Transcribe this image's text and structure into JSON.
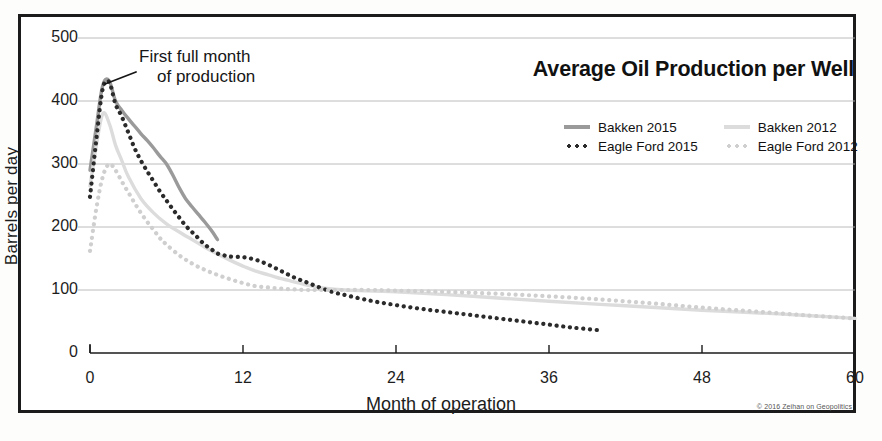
{
  "title": "Average Oil Production per Well",
  "annotation": {
    "line1": "First full month",
    "line2": "of production"
  },
  "copyright": "© 2016 Zeihan on Geopolitics",
  "axes": {
    "ylabel": "Barrels per day",
    "xlabel": "Month of operation",
    "yticks": [
      "500",
      "400",
      "300",
      "200",
      "100",
      "0"
    ],
    "xticks": [
      "0",
      "12",
      "24",
      "36",
      "48",
      "60"
    ]
  },
  "legend": {
    "entries": [
      {
        "label": "Bakken 2015",
        "style": "solid",
        "color": "#9a9a9a",
        "swatch": "sw-solid-dark"
      },
      {
        "label": "Bakken 2012",
        "style": "solid",
        "color": "#dcdcdc",
        "swatch": "sw-solid-light"
      },
      {
        "label": "Eagle Ford 2015",
        "style": "dotted",
        "color": "#2b2b2b",
        "swatch": "sw-dots-dark"
      },
      {
        "label": "Eagle Ford 2012",
        "style": "dotted",
        "color": "#cfcfcf",
        "swatch": "sw-dots-light"
      }
    ]
  },
  "chart_data": {
    "type": "line",
    "title": "Average Oil Production per Well",
    "xlabel": "Month of operation",
    "ylabel": "Barrels per day",
    "xlim": [
      0,
      60
    ],
    "ylim": [
      0,
      500
    ],
    "grid": true,
    "legend_position": "upper-right",
    "annotations": [
      {
        "text": "First full month of production",
        "points_to_x": 1.2,
        "points_to_y": 432
      }
    ],
    "series": [
      {
        "name": "Bakken 2015",
        "color": "#9a9a9a",
        "style": "solid",
        "x": [
          0,
          0.5,
          1,
          1.5,
          2,
          2.5,
          3,
          3.5,
          4,
          4.5,
          5,
          5.5,
          6,
          6.5,
          7,
          7.5,
          8,
          8.5,
          9,
          9.5,
          10
        ],
        "y": [
          290,
          360,
          425,
          432,
          400,
          385,
          372,
          360,
          348,
          337,
          325,
          312,
          300,
          282,
          262,
          245,
          232,
          220,
          208,
          195,
          180
        ]
      },
      {
        "name": "Bakken 2012",
        "color": "#dcdcdc",
        "style": "solid",
        "x": [
          0,
          0.5,
          1,
          1.5,
          2,
          2.5,
          3,
          4,
          5,
          6,
          7,
          8,
          9,
          10,
          11,
          12,
          13,
          14,
          15,
          16,
          17,
          18,
          20,
          24,
          30,
          36,
          42,
          48,
          54,
          60
        ],
        "y": [
          265,
          330,
          380,
          365,
          330,
          305,
          280,
          245,
          222,
          205,
          192,
          180,
          168,
          157,
          147,
          138,
          130,
          124,
          118,
          113,
          108,
          104,
          100,
          97,
          90,
          82,
          75,
          68,
          62,
          55
        ]
      },
      {
        "name": "Eagle Ford 2015",
        "color": "#2b2b2b",
        "style": "dotted",
        "x": [
          0,
          0.5,
          1,
          1.5,
          2,
          2.5,
          3,
          3.5,
          4,
          4.5,
          5,
          5.5,
          6,
          6.5,
          7,
          7.5,
          8,
          8.5,
          9,
          9.5,
          10,
          10.5,
          11,
          12,
          13,
          14,
          15,
          16,
          17,
          18,
          19,
          20,
          22,
          24,
          26,
          28,
          30,
          32,
          34,
          36,
          38,
          40
        ],
        "y": [
          248,
          340,
          420,
          430,
          395,
          375,
          350,
          325,
          305,
          288,
          272,
          256,
          242,
          228,
          215,
          202,
          192,
          182,
          172,
          165,
          158,
          155,
          153,
          152,
          148,
          140,
          130,
          120,
          112,
          104,
          97,
          92,
          83,
          76,
          70,
          65,
          60,
          55,
          50,
          45,
          40,
          36
        ]
      },
      {
        "name": "Eagle Ford 2012",
        "color": "#cfcfcf",
        "style": "dotted",
        "x": [
          0,
          0.5,
          1,
          1.5,
          2,
          2.5,
          3,
          3.5,
          4,
          4.5,
          5,
          5.5,
          6,
          7,
          8,
          9,
          10,
          11,
          12,
          13,
          14,
          15,
          16,
          17,
          18,
          20,
          22,
          24,
          28,
          32,
          36,
          40,
          44,
          48,
          52,
          56,
          60
        ],
        "y": [
          162,
          230,
          280,
          300,
          290,
          272,
          255,
          238,
          222,
          208,
          195,
          182,
          172,
          155,
          142,
          132,
          124,
          117,
          111,
          106,
          104,
          102,
          101,
          100,
          100,
          100,
          100,
          99,
          97,
          94,
          90,
          85,
          79,
          72,
          66,
          60,
          55
        ]
      }
    ]
  }
}
